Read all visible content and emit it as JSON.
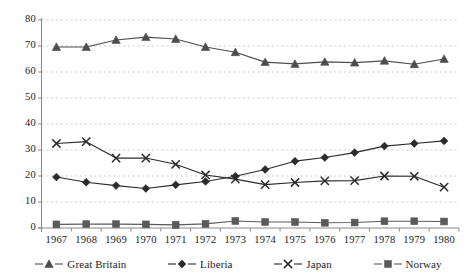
{
  "chart_data": {
    "type": "line",
    "title": "",
    "subtitle": "",
    "xlabel": "",
    "ylabel": "",
    "categories": [
      "1967",
      "1968",
      "1969",
      "1970",
      "1971",
      "1972",
      "1973",
      "1974",
      "1975",
      "1976",
      "1977",
      "1978",
      "1979",
      "1980"
    ],
    "ylim": [
      0,
      80
    ],
    "yticks": [
      0,
      10,
      20,
      30,
      40,
      50,
      60,
      70,
      80
    ],
    "grid": true,
    "grid_style": "dashed-horizontal",
    "legend_position": "bottom",
    "series": [
      {
        "name": "Great Britain",
        "marker": "triangle",
        "color": "#4d4d4d",
        "values": [
          69.6,
          69.6,
          72.3,
          73.4,
          72.7,
          69.6,
          67.6,
          63.8,
          63.1,
          63.9,
          63.6,
          64.3,
          63.0,
          65.0
        ]
      },
      {
        "name": "Liberia",
        "marker": "diamond",
        "color": "#2b2b2b",
        "values": [
          19.6,
          17.6,
          16.3,
          15.2,
          16.6,
          17.9,
          19.9,
          22.5,
          25.7,
          27.1,
          29.0,
          31.5,
          32.5,
          33.5
        ]
      },
      {
        "name": "Japan",
        "marker": "x",
        "color": "#2b2b2b",
        "values": [
          32.5,
          33.2,
          26.9,
          26.9,
          24.5,
          20.4,
          18.8,
          16.7,
          17.5,
          18.1,
          18.2,
          20.0,
          19.9,
          15.7
        ]
      },
      {
        "name": "Norway",
        "marker": "square",
        "color": "#5a5a5a",
        "values": [
          1.4,
          1.5,
          1.5,
          1.4,
          1.2,
          1.6,
          2.7,
          2.3,
          2.3,
          2.0,
          2.1,
          2.6,
          2.6,
          2.5
        ]
      }
    ]
  },
  "axis": {
    "y_tick_labels": [
      "80",
      "70",
      "60",
      "50",
      "40",
      "30",
      "20",
      "10",
      "0"
    ],
    "x_tick_labels": [
      "1967",
      "1968",
      "1969",
      "1970",
      "1971",
      "1972",
      "1973",
      "1974",
      "1975",
      "1976",
      "1977",
      "1978",
      "1979",
      "1980"
    ]
  },
  "legend": {
    "items": [
      {
        "label": "Great Britain",
        "marker": "triangle-marker",
        "color": "#4d4d4d"
      },
      {
        "label": "Liberia",
        "marker": "diamond-marker",
        "color": "#2b2b2b"
      },
      {
        "label": "Japan",
        "marker": "x-marker",
        "color": "#2b2b2b"
      },
      {
        "label": "Norway",
        "marker": "square-marker",
        "color": "#5a5a5a"
      }
    ]
  },
  "style": {
    "background": "#ffffff",
    "axis_color": "#8a8a8a",
    "grid_color": "#c9c9c9",
    "text_color": "#1c1c1c"
  }
}
